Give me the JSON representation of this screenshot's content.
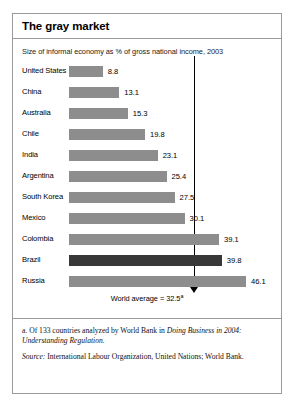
{
  "chart_data": {
    "type": "bar",
    "orientation": "horizontal",
    "title": "The gray market",
    "subtitle": "Size of informal economy as % of gross national income, 2003",
    "xlabel": "",
    "ylabel": "",
    "xlim": [
      0,
      46.1
    ],
    "grid": false,
    "legend": null,
    "categories": [
      "United States",
      "China",
      "Australia",
      "Chile",
      "India",
      "Argentina",
      "South Korea",
      "Mexico",
      "Colombia",
      "Brazil",
      "Russia"
    ],
    "values": [
      8.8,
      13.1,
      15.3,
      19.8,
      23.1,
      25.4,
      27.5,
      30.1,
      39.1,
      39.8,
      46.1
    ],
    "value_labels": [
      "8.8",
      "13.1",
      "15.3",
      "19.8",
      "23.1",
      "25.4",
      "27.5",
      "30.1",
      "39.1",
      "39.8",
      "46.1"
    ],
    "highlighted_category": "Brazil",
    "annotations": [
      {
        "type": "reference-line",
        "value": 32.5,
        "label": "World average = 32.5",
        "footnote_marker": "a"
      }
    ],
    "colors": {
      "bar": "#8d8d8d",
      "bar_highlight": "#383838",
      "reference_line": "#000000",
      "border": "#9a9a9a",
      "background": "#ffffff",
      "text": "#000000"
    }
  },
  "footnotes": {
    "note_a_prefix": "a. Of 133 countries analyzed by World Bank in ",
    "note_a_italic": "Doing Business in 2004: Understanding Regulation.",
    "source_label": "Source:",
    "source_text": " International Labour Organization, United Nations; World Bank."
  }
}
